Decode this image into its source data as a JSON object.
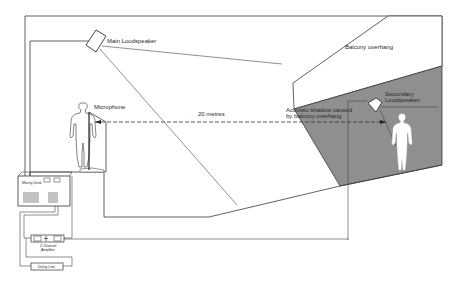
{
  "diagram": {
    "type": "sound-reinforcement-layout",
    "labels": {
      "main_loudspeaker": "Main Loudspeaker",
      "microphone": "Microphone",
      "distance": "20 metres",
      "balcony_overhang": "Balcony overhang",
      "acoustic_shadow_line1": "Acoustic shadow caused",
      "acoustic_shadow_line2": "by balcony overhang",
      "secondary_loudspeaker_line1": "Secondary",
      "secondary_loudspeaker_line2": "Loudspeaker",
      "mixing_desk": "Mixing Desk",
      "amplifier_line1": "2 Channel",
      "amplifier_line2": "Amplifier",
      "delay_line": "Delay Line"
    },
    "colors": {
      "line": "#3a3a3a",
      "shadow_fill": "#8f8f8f",
      "background": "#ffffff",
      "figure_fill": "#ffffff"
    }
  }
}
